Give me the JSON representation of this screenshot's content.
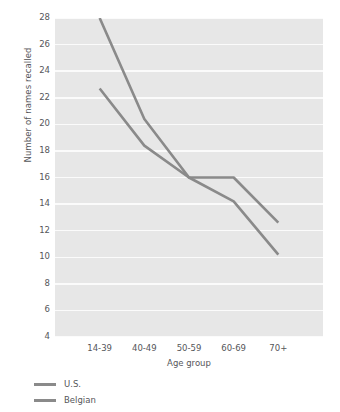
{
  "chart_data": {
    "type": "line",
    "title": "",
    "xlabel": "Age group",
    "ylabel": "Number of names recalled",
    "categories": [
      "14-39",
      "40-49",
      "50-59",
      "60-69",
      "70+"
    ],
    "ylim": [
      4,
      28
    ],
    "yticks": [
      4,
      6,
      8,
      10,
      12,
      14,
      16,
      18,
      20,
      22,
      24,
      26,
      28
    ],
    "grid": true,
    "legend_position": "below-left",
    "series": [
      {
        "name": "U.S.",
        "color": "#8a8a8a",
        "values": [
          22.7,
          18.4,
          16.0,
          16.0,
          12.6
        ]
      },
      {
        "name": "Belgian",
        "color": "#8a8a8a",
        "values": [
          28.0,
          20.4,
          16.0,
          14.2,
          10.2
        ]
      }
    ],
    "plot_background": "#e7e7e7",
    "gridline_color": "#fbfbfb"
  }
}
